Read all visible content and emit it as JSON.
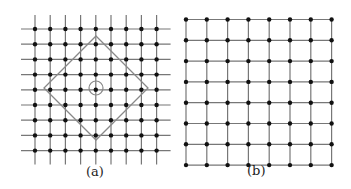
{
  "panels": [
    {
      "id": "a",
      "caption": "(a)",
      "grid": {
        "rows": 9,
        "cols": 9,
        "x0": 35,
        "y0": 29,
        "step": 15.2,
        "extend": 14
      },
      "diamond": {
        "cx": 96,
        "cy": 88,
        "r": 52,
        "color": "#888888"
      },
      "center_marker": {
        "cx": 96,
        "cy": 88,
        "r": 7,
        "color": "#888888"
      }
    },
    {
      "id": "b",
      "caption": "(b)",
      "grid": {
        "rows": 8,
        "cols": 8,
        "x0": 186,
        "y0": 19.5,
        "step": 20.8,
        "extend": 0
      }
    }
  ],
  "colors": {
    "line": "#777777",
    "dot": "#111111"
  }
}
